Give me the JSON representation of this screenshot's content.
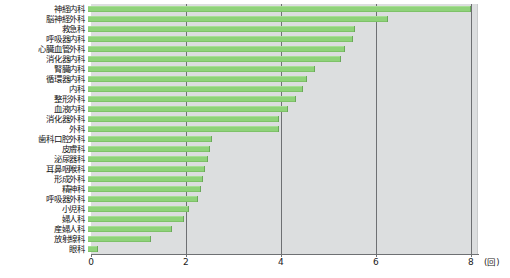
{
  "chart_data": {
    "type": "bar",
    "orientation": "horizontal",
    "title": "",
    "xlabel": "(回)",
    "ylabel": "",
    "xlim": [
      0,
      8.15
    ],
    "ticks": [
      0,
      2,
      4,
      6,
      8
    ],
    "tick_labels": [
      "0",
      "2",
      "4",
      "6",
      "8"
    ],
    "unit": "(回)",
    "grid": true,
    "legend": "none",
    "bar_color": "#8fd27a",
    "plot_background": "#dcdedf",
    "categories": [
      "神経内科",
      "脳神経外科",
      "救急科",
      "呼吸器内科",
      "心臓血管外科",
      "消化器内科",
      "腎臓内科",
      "循環器内科",
      "内科",
      "整形外科",
      "血液内科",
      "消化器外科",
      "外科",
      "歯科口腔外科",
      "皮膚科",
      "泌尿器科",
      "耳鼻咽喉科",
      "形成外科",
      "精神科",
      "呼吸器外科",
      "小児科",
      "婦人科",
      "産婦人科",
      "放射線科",
      "眼科"
    ],
    "values": [
      8.05,
      6.3,
      5.6,
      5.55,
      5.4,
      5.3,
      4.75,
      4.6,
      4.5,
      4.35,
      4.2,
      4.0,
      4.0,
      2.6,
      2.55,
      2.5,
      2.45,
      2.4,
      2.35,
      2.3,
      2.1,
      2.0,
      1.75,
      1.3,
      0.2
    ]
  }
}
